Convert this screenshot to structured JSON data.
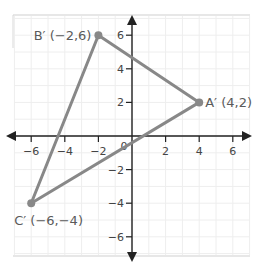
{
  "diagram": {
    "type": "coordinate-plane",
    "x_range": [
      -7,
      7
    ],
    "y_range": [
      -7,
      7
    ],
    "x_ticks": [
      {
        "value": -6,
        "label": "−6"
      },
      {
        "value": -4,
        "label": "−4"
      },
      {
        "value": -2,
        "label": "−2"
      },
      {
        "value": 2,
        "label": "2"
      },
      {
        "value": 4,
        "label": "4"
      },
      {
        "value": 6,
        "label": "6"
      }
    ],
    "y_ticks": [
      {
        "value": 6,
        "label": "6"
      },
      {
        "value": 4,
        "label": "4"
      },
      {
        "value": 2,
        "label": "2"
      },
      {
        "value": -2,
        "label": "−2"
      },
      {
        "value": -4,
        "label": "−4"
      },
      {
        "value": -6,
        "label": "−6"
      }
    ],
    "origin_label": "0",
    "triangle": {
      "points": [
        {
          "name": "A'",
          "x": 4,
          "y": 2,
          "label": "A′ (4,2)"
        },
        {
          "name": "B'",
          "x": -2,
          "y": 6,
          "label": "B′ (−2,6)"
        },
        {
          "name": "C'",
          "x": -6,
          "y": -4,
          "label": "C′ (−6,−4)"
        }
      ]
    },
    "colors": {
      "triangle_stroke": "#888888",
      "axis": "#222222",
      "grid": "#eeeeee",
      "label": "#5a5a5a"
    }
  }
}
